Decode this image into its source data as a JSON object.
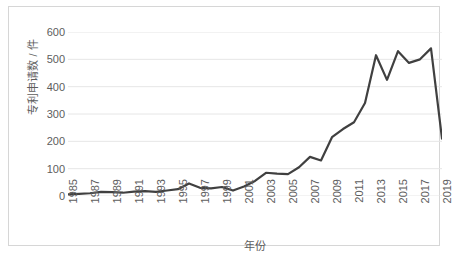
{
  "chart_data": {
    "type": "line",
    "title": "",
    "xlabel": "年份",
    "ylabel": "专利申请数 / 件",
    "xlim": [
      1985,
      2019
    ],
    "ylim": [
      0,
      600
    ],
    "ytick_labels": [
      "600",
      "500",
      "400",
      "300",
      "200",
      "100",
      "0"
    ],
    "ytick_values": [
      600,
      500,
      400,
      300,
      200,
      100,
      0
    ],
    "xtick_labels": [
      "1985",
      "1987",
      "1989",
      "1991",
      "1993",
      "1995",
      "1997",
      "1999",
      "2001",
      "2003",
      "2005",
      "2007",
      "2009",
      "2011",
      "2013",
      "2015",
      "2017",
      "2019"
    ],
    "grid": "horizontal",
    "legend": "none",
    "line_color": "#404040",
    "line_width": 2.2,
    "x": [
      1985,
      1986,
      1987,
      1988,
      1989,
      1990,
      1991,
      1992,
      1993,
      1994,
      1995,
      1996,
      1997,
      1998,
      1999,
      2000,
      2001,
      2002,
      2003,
      2004,
      2005,
      2006,
      2007,
      2008,
      2009,
      2010,
      2011,
      2012,
      2013,
      2014,
      2015,
      2016,
      2017,
      2018,
      2019
    ],
    "values": [
      6,
      8,
      10,
      15,
      14,
      12,
      16,
      18,
      15,
      20,
      25,
      46,
      30,
      28,
      33,
      20,
      35,
      55,
      85,
      82,
      80,
      105,
      143,
      130,
      215,
      245,
      270,
      340,
      515,
      425,
      530,
      487,
      500,
      540,
      210
    ],
    "series": [
      {
        "name": "专利申请数",
        "values": [
          6,
          8,
          10,
          15,
          14,
          12,
          16,
          18,
          15,
          20,
          25,
          46,
          30,
          28,
          33,
          20,
          35,
          55,
          85,
          82,
          80,
          105,
          143,
          130,
          215,
          245,
          270,
          340,
          515,
          425,
          530,
          487,
          500,
          540,
          210
        ]
      }
    ]
  },
  "caption": ""
}
